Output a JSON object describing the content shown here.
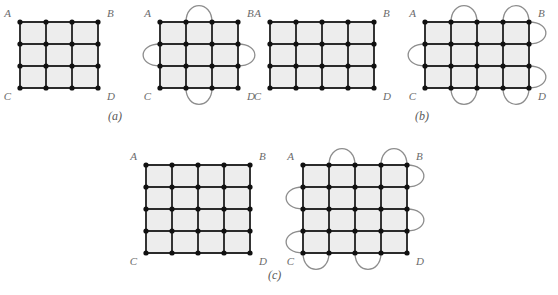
{
  "figure": {
    "background_color": "#ffffff",
    "edge_color": "#2b2b2b",
    "node_color": "#111111",
    "arc_color": "#8d8d8d",
    "cell_fill": "#ededed",
    "label_color": "#6b6b6b",
    "corner_labels": [
      "A",
      "B",
      "C",
      "D"
    ],
    "captions": [
      {
        "id": "a",
        "text": "(a)"
      },
      {
        "id": "b",
        "text": "(b)"
      },
      {
        "id": "c",
        "text": "(c)"
      }
    ],
    "panels": [
      {
        "id": "a-left",
        "name": "grid-3x3-plain",
        "origin": [
          20,
          22
        ],
        "cols": 3,
        "rows": 3,
        "cell_w": 26,
        "cell_h": 22,
        "arcs": [],
        "labels": {
          "A": "A",
          "B": "B",
          "C": "C",
          "D": "D"
        }
      },
      {
        "id": "a-right",
        "name": "grid-3x3-with-arcs",
        "origin": [
          160,
          22
        ],
        "cols": 3,
        "rows": 3,
        "cell_w": 26,
        "cell_h": 22,
        "arcs": [
          {
            "side": "top",
            "from": 1,
            "to": 2
          },
          {
            "side": "bottom",
            "from": 1,
            "to": 2
          },
          {
            "side": "left",
            "from": 1,
            "to": 2
          },
          {
            "side": "right",
            "from": 1,
            "to": 2
          }
        ],
        "labels": {
          "A": "A",
          "B": "B",
          "C": "C",
          "D": "D"
        }
      },
      {
        "id": "b-left",
        "name": "grid-4x3-plain",
        "origin": [
          270,
          22
        ],
        "cols": 4,
        "rows": 3,
        "cell_w": 26,
        "cell_h": 22,
        "arcs": [],
        "labels": {
          "A": "A",
          "B": "B",
          "C": "C",
          "D": "D"
        }
      },
      {
        "id": "b-right",
        "name": "grid-4x3-with-arcs",
        "origin": [
          425,
          22
        ],
        "cols": 4,
        "rows": 3,
        "cell_w": 26,
        "cell_h": 22,
        "arcs": [
          {
            "side": "top",
            "from": 1,
            "to": 2
          },
          {
            "side": "top",
            "from": 3,
            "to": 4
          },
          {
            "side": "bottom",
            "from": 1,
            "to": 2
          },
          {
            "side": "bottom",
            "from": 3,
            "to": 4
          },
          {
            "side": "left",
            "from": 1,
            "to": 2
          },
          {
            "side": "right",
            "from": 0,
            "to": 1
          },
          {
            "side": "right",
            "from": 2,
            "to": 3
          }
        ],
        "labels": {
          "A": "A",
          "B": "B",
          "C": "C",
          "D": "D"
        }
      },
      {
        "id": "c-left",
        "name": "grid-4x4-plain",
        "origin": [
          146,
          165
        ],
        "cols": 4,
        "rows": 4,
        "cell_w": 26,
        "cell_h": 22,
        "arcs": [],
        "labels": {
          "A": "A",
          "B": "B",
          "C": "C",
          "D": "D"
        }
      },
      {
        "id": "c-right",
        "name": "grid-4x4-with-arcs",
        "origin": [
          303,
          165
        ],
        "cols": 4,
        "rows": 4,
        "cell_w": 26,
        "cell_h": 22,
        "arcs": [
          {
            "side": "top",
            "from": 1,
            "to": 2
          },
          {
            "side": "top",
            "from": 3,
            "to": 4
          },
          {
            "side": "bottom",
            "from": 0,
            "to": 1
          },
          {
            "side": "bottom",
            "from": 2,
            "to": 3
          },
          {
            "side": "left",
            "from": 1,
            "to": 2
          },
          {
            "side": "left",
            "from": 3,
            "to": 4
          },
          {
            "side": "right",
            "from": 0,
            "to": 1
          },
          {
            "side": "right",
            "from": 2,
            "to": 3
          }
        ],
        "labels": {
          "A": "A",
          "B": "B",
          "C": "C",
          "D": "D"
        }
      }
    ]
  }
}
